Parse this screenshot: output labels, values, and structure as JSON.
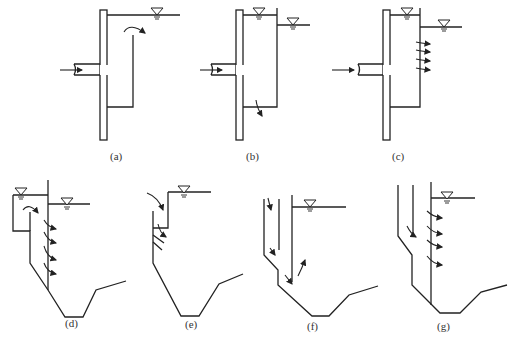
{
  "figure": {
    "panels": [
      {
        "id": "a",
        "label": "(a)"
      },
      {
        "id": "b",
        "label": "(b)"
      },
      {
        "id": "c",
        "label": "(c)"
      },
      {
        "id": "d",
        "label": "(d)"
      },
      {
        "id": "e",
        "label": "(e)"
      },
      {
        "id": "f",
        "label": "(f)"
      },
      {
        "id": "g",
        "label": "(g)"
      }
    ],
    "symbols": {
      "water_level": "inverted-triangle water surface marker",
      "flow_arrow": "curved flow-direction arrow"
    },
    "line_color": "#222222",
    "background": "#ffffff"
  }
}
